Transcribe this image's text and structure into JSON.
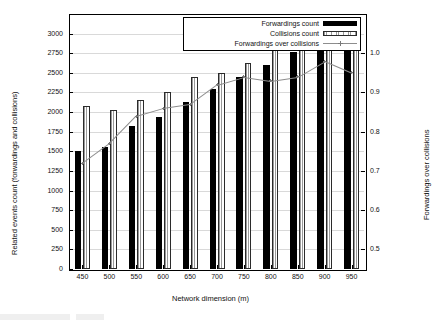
{
  "chart_data": {
    "type": "bar",
    "title": "",
    "xlabel": "Network dimension (m)",
    "ylabel": "Related events count (forwardings and collisions)",
    "ylabel_right": "Forwardings over collisions",
    "categories": [
      "450",
      "500",
      "550",
      "600",
      "650",
      "700",
      "750",
      "800",
      "850",
      "900",
      "950"
    ],
    "ylim": [
      0,
      3250
    ],
    "yticks": [
      "0",
      "250",
      "500",
      "750",
      "1000",
      "1250",
      "1500",
      "1750",
      "2000",
      "2250",
      "2500",
      "2750",
      "3000"
    ],
    "ylim_right": [
      0.45,
      1.1
    ],
    "yticks_right": [
      "0.5",
      "0.6",
      "0.7",
      "0.8",
      "0.9",
      "1.0"
    ],
    "grid": true,
    "legend_position": "top-right",
    "series": [
      {
        "name": "Forwardings count",
        "key": "forwardings",
        "axis": "left",
        "style": "bar-solid",
        "color": "#000000",
        "values": [
          1500,
          1560,
          1820,
          1940,
          2130,
          2290,
          2450,
          2600,
          2760,
          2960,
          2840
        ]
      },
      {
        "name": "Collisions count",
        "key": "collisions",
        "axis": "left",
        "style": "bar-hatched",
        "color": "#ffffff",
        "values": [
          2080,
          2030,
          2160,
          2250,
          2450,
          2500,
          2620,
          2800,
          2930,
          3030,
          3000
        ]
      },
      {
        "name": "Forwardings over collisions",
        "key": "ratio",
        "axis": "right",
        "style": "line-points",
        "color": "#8d8d8d",
        "values": [
          0.72,
          0.77,
          0.84,
          0.86,
          0.87,
          0.92,
          0.94,
          0.93,
          0.94,
          0.98,
          0.95
        ]
      }
    ]
  }
}
